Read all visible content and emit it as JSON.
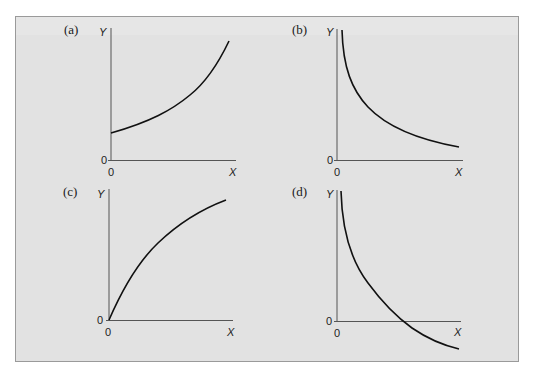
{
  "colors": {
    "page_background": "#ffffff",
    "panel_background": "#e2e2e2",
    "frame_border": "#9a9a9a",
    "axis": "#555555",
    "curve": "#111111"
  },
  "panels": [
    {
      "label": "(a)",
      "y_axis_label": "Y",
      "x_axis_label": "X",
      "y_origin_label": "0",
      "x_origin_label": "0",
      "shape": "increasing-convex",
      "description": "Curve starts at positive Y-intercept and increases at an increasing rate"
    },
    {
      "label": "(b)",
      "y_axis_label": "Y",
      "x_axis_label": "X",
      "y_origin_label": "0",
      "x_origin_label": "0",
      "shape": "decreasing-convex",
      "description": "Curve decreases at a decreasing rate, approaching the X axis asymptotically"
    },
    {
      "label": "(c)",
      "y_axis_label": "Y",
      "x_axis_label": "X",
      "y_origin_label": "0",
      "x_origin_label": "0",
      "shape": "increasing-concave",
      "description": "Curve starts at the origin and increases at a decreasing rate"
    },
    {
      "label": "(d)",
      "y_axis_label": "Y",
      "x_axis_label": "X",
      "y_origin_label": "0",
      "x_origin_label": "0",
      "shape": "decreasing-convex-crossing",
      "description": "Curve decreases at a decreasing rate, crosses the X axis and becomes negative"
    }
  ]
}
